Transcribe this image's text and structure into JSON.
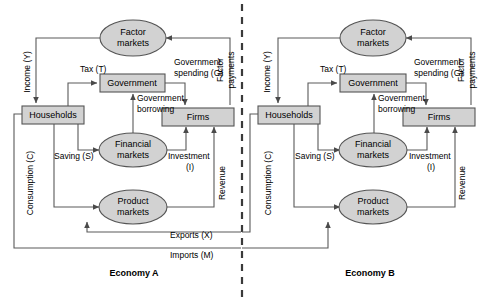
{
  "diagram": {
    "title_visible": false,
    "type": "circular-flow-two-economies",
    "divider": {
      "name": "center-dashed-divider",
      "x": 242,
      "style": "dashed"
    },
    "colors": {
      "node_fill": "#d2d2d2",
      "node_stroke": "#555555",
      "flow_line": "#555555",
      "text": "#000000",
      "divider": "#3a3a3a",
      "background": "#ffffff"
    }
  },
  "economies": [
    {
      "id": "A",
      "caption": "Economy A",
      "nodes": {
        "factor_markets": "Factor\nmarkets",
        "factor_markets_l1": "Factor",
        "factor_markets_l2": "markets",
        "government": "Government",
        "households": "Households",
        "firms": "Firms",
        "financial_markets_l1": "Financial",
        "financial_markets_l2": "markets",
        "product_markets_l1": "Product",
        "product_markets_l2": "markets"
      },
      "flows": {
        "income": "Income (Y)",
        "tax": "Tax (T)",
        "government_spending_l1": "Government",
        "government_spending_l2": "spending (G)",
        "government_borrowing_l1": "Government",
        "government_borrowing_l2": "borrowing",
        "consumption": "Consumption (C)",
        "saving": "Saving (S)",
        "investment_l1": "Investment",
        "investment_l2": "(I)",
        "factor_payments_l1": "Factor",
        "factor_payments_l2": "payments",
        "revenue": "Revenue"
      }
    },
    {
      "id": "B",
      "caption": "Economy B",
      "nodes": {
        "factor_markets_l1": "Factor",
        "factor_markets_l2": "markets",
        "government": "Government",
        "households": "Households",
        "firms": "Firms",
        "financial_markets_l1": "Financial",
        "financial_markets_l2": "markets",
        "product_markets_l1": "Product",
        "product_markets_l2": "markets"
      },
      "flows": {
        "income": "Income (Y)",
        "tax": "Tax (T)",
        "government_spending_l1": "Government",
        "government_spending_l2": "spending (G)",
        "government_borrowing_l1": "Government",
        "government_borrowing_l2": "borrowing",
        "consumption": "Consumption (C)",
        "saving": "Saving (S)",
        "investment_l1": "Investment",
        "investment_l2": "(I)",
        "factor_payments_l1": "Factor",
        "factor_payments_l2": "payments",
        "revenue": "Revenue"
      }
    }
  ],
  "cross_border_flows": {
    "exports": "Exports (X)",
    "imports": "Imports (M)"
  }
}
